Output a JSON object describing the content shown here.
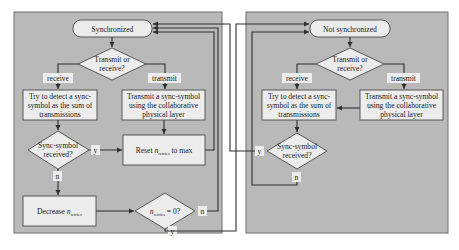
{
  "left_state": {
    "title": "Synchronized",
    "decision_tx_rx": [
      "Transmit or",
      "receive?"
    ],
    "label_receive": "receive",
    "label_transmit": "transmit",
    "detect_box": [
      "Try to detect a sync-",
      "symbol as the sum of",
      "transmissions"
    ],
    "transmit_box": [
      "Transmit a sync-symbol",
      "using the collaborative",
      "physical layer"
    ],
    "decision_received": [
      "Sync-symbol",
      "received?"
    ],
    "label_yes": "y",
    "label_no": "n",
    "reset_box": {
      "prefix": "Reset ",
      "var": "n",
      "sub": "retries",
      "suffix": " to max"
    },
    "decrease_box": {
      "prefix": "Decrease ",
      "var": "n",
      "sub": "retries"
    },
    "decision_zero": {
      "var": "n",
      "sub": "retries",
      "suffix": " = 0?"
    },
    "label_zero_no": "n",
    "label_zero_yes": "y"
  },
  "right_state": {
    "title": "Not synchronized",
    "decision_tx_rx": [
      "Transmit or",
      "receive?"
    ],
    "label_receive": "receive",
    "label_transmit": "transmit",
    "detect_box": [
      "Try to detect a sync-",
      "symbol as the sum of",
      "transmissions"
    ],
    "transmit_box": [
      "Transmit a sync-symbol",
      "using the collaborative",
      "physical layer"
    ],
    "decision_received": [
      "Sync-symbol",
      "received?"
    ],
    "label_yes": "y",
    "label_no": "n"
  },
  "colors": {
    "panel": "#b9b9b9",
    "box": "#ececec",
    "line": "#2e2e2e"
  }
}
